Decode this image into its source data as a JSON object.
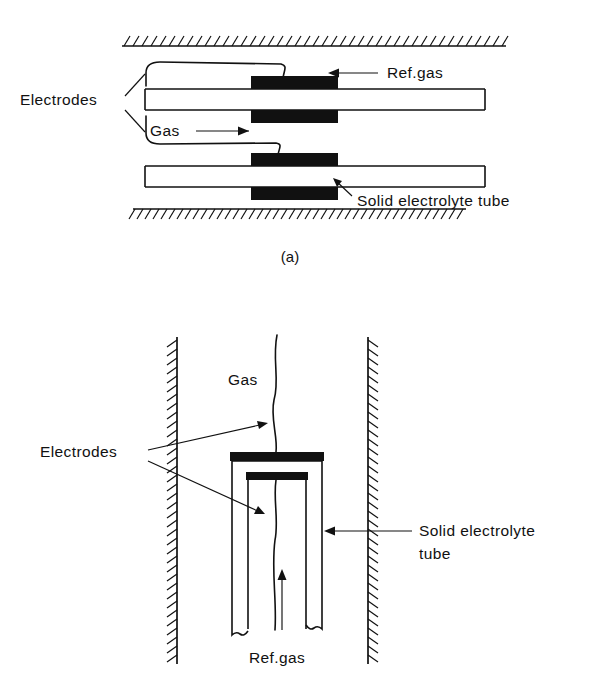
{
  "figure": {
    "caption_a": "(a)",
    "ink_color": "#111111",
    "background_color": "#ffffff"
  },
  "panel_a": {
    "name": "flow-through tube sensor",
    "labels": {
      "electrodes": "Electrodes",
      "gas": "Gas",
      "ref_gas": "Ref.gas",
      "solid_electrolyte_tube": "Solid electrolyte tube"
    },
    "caption": "(a)",
    "arrows": {
      "gas_direction": "right",
      "ref_gas_direction": "left",
      "tube_pointer_direction": "up-left"
    },
    "walls": {
      "top_hatch_side": "above",
      "bottom_hatch_side": "below"
    }
  },
  "panel_b": {
    "name": "closed-end tube sensor",
    "labels": {
      "electrodes": "Electrodes",
      "gas": "Gas",
      "ref_gas": "Ref.gas",
      "solid_electrolyte_tube_line1": "Solid electrolyte",
      "solid_electrolyte_tube_line2": "tube"
    },
    "arrows": {
      "ref_gas_direction": "up",
      "tube_pointer_direction": "left",
      "electrode_pointer_count": 2
    },
    "walls": {
      "left_hatch_side": "left",
      "right_hatch_side": "right"
    }
  }
}
